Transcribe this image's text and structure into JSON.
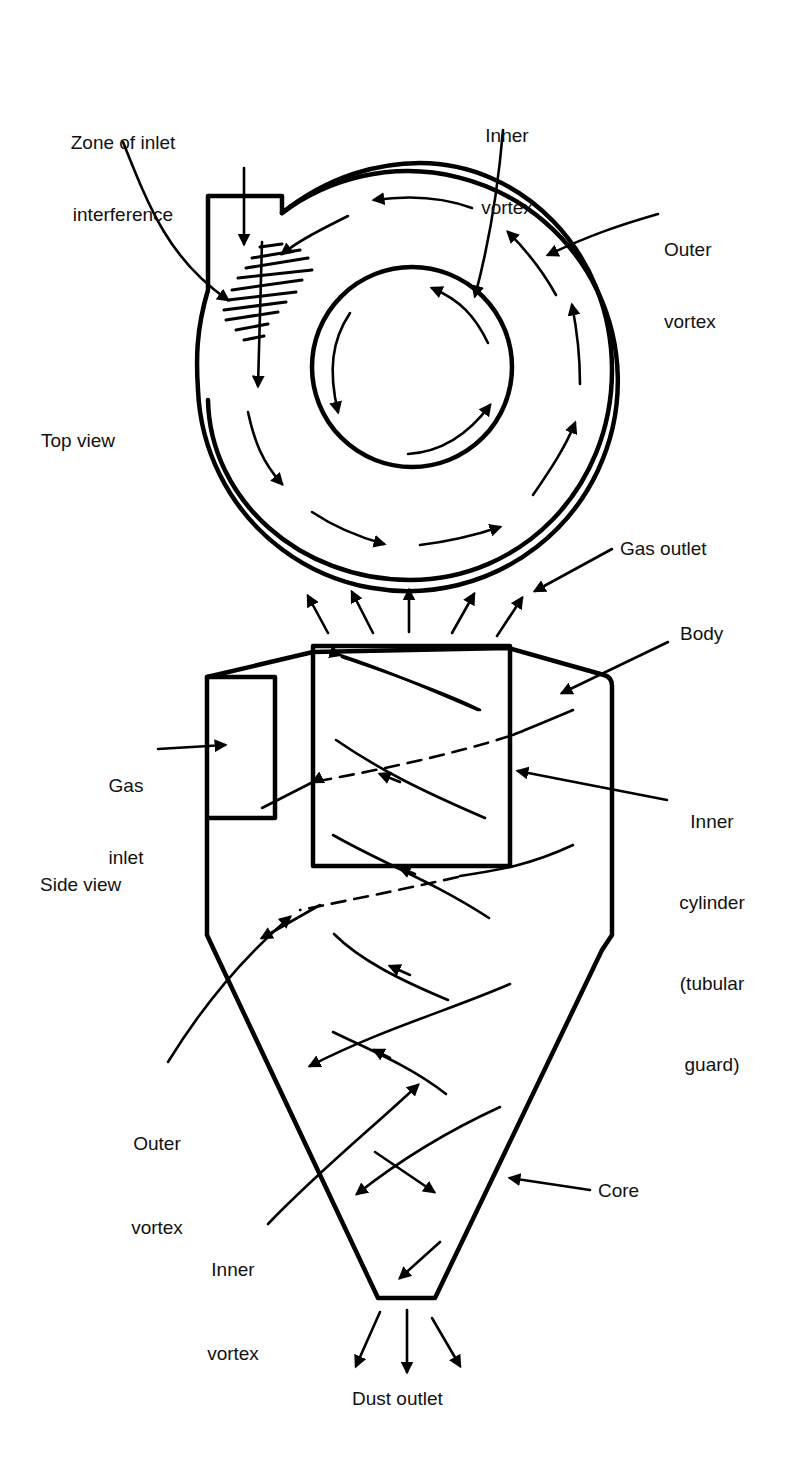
{
  "figure": {
    "views": {
      "top_view_label": "Top view",
      "side_view_label": "Side view"
    },
    "labels": {
      "zone_of_inlet_interference": {
        "line1": "Zone of inlet",
        "line2": "interference"
      },
      "inner_vortex_top": {
        "line1": "Inner",
        "line2": "vortex"
      },
      "outer_vortex_top": {
        "line1": "Outer",
        "line2": "vortex"
      },
      "gas_outlet": "Gas outlet",
      "body": "Body",
      "gas_inlet": {
        "line1": "Gas",
        "line2": "inlet"
      },
      "inner_cylinder": {
        "line1": "Inner",
        "line2": "cylinder",
        "line3": "(tubular",
        "line4": "guard)"
      },
      "outer_vortex_side": {
        "line1": "Outer",
        "line2": "vortex"
      },
      "inner_vortex_side": {
        "line1": "Inner",
        "line2": "vortex"
      },
      "core": "Core",
      "dust_outlet": "Dust outlet"
    },
    "colors": {
      "ink": "#000000",
      "background": "#ffffff"
    }
  }
}
